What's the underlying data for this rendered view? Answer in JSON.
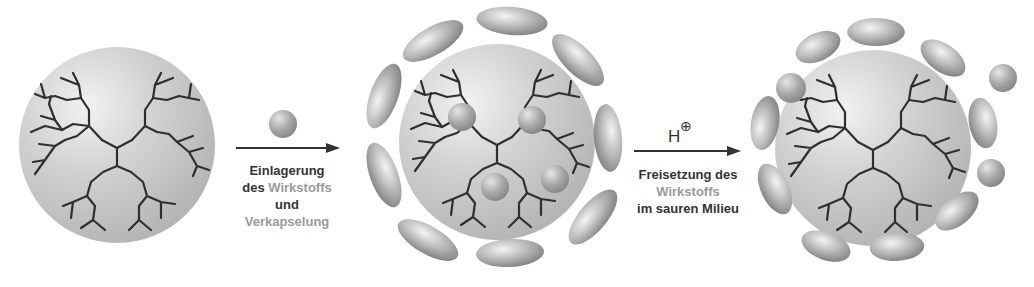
{
  "diagram": {
    "type": "process-flow",
    "stages": [
      {
        "id": "empty-dendrimer",
        "description": "Dendrimer sphere without drug"
      },
      {
        "id": "loaded-encapsulated",
        "description": "Dendrimer with 4 drug molecules encapsulated by 12 ellipsoid shell units"
      },
      {
        "id": "release",
        "description": "Dendrimer releasing drug molecules; shell partially opened"
      }
    ],
    "steps": [
      {
        "label_lines": [
          {
            "parts": [
              {
                "text": "Einlagerung",
                "muted": false
              }
            ]
          },
          {
            "parts": [
              {
                "text": "des ",
                "muted": false
              },
              {
                "text": "Wirkstoffs",
                "muted": true
              }
            ]
          },
          {
            "parts": [
              {
                "text": "und",
                "muted": false
              }
            ]
          },
          {
            "parts": [
              {
                "text": "Verkapselung",
                "muted": true
              }
            ]
          }
        ],
        "above_arrow": "drug-sphere"
      },
      {
        "label_lines": [
          {
            "parts": [
              {
                "text": "Freisetzung des",
                "muted": false
              }
            ]
          },
          {
            "parts": [
              {
                "text": "Wirkstoffs",
                "muted": true
              }
            ]
          },
          {
            "parts": [
              {
                "text": "im sauren Milieu",
                "muted": false
              }
            ]
          }
        ],
        "above_arrow": "proton",
        "proton": {
          "symbol": "H",
          "charge": "⊕"
        }
      }
    ],
    "colors": {
      "text": "#333333",
      "muted_text": "#9a9a9a",
      "sphere": "#c8c8c8",
      "branch": "#2f2f2f",
      "shell": "#a9a9a9"
    }
  }
}
